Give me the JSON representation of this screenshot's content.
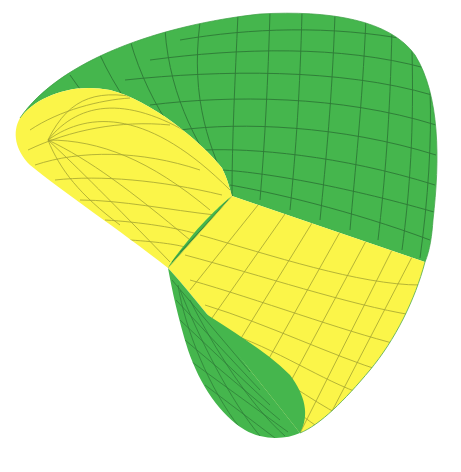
{
  "figure": {
    "subject": "3D parametric surface rendering",
    "colors": {
      "background": "#ffffff",
      "outer_face": "#45b64d",
      "inner_face": "#fbf549",
      "mesh_on_green": "#2a6e33",
      "mesh_on_yellow": "#9a9a30",
      "edge_shadow": "#3a9e42"
    }
  }
}
